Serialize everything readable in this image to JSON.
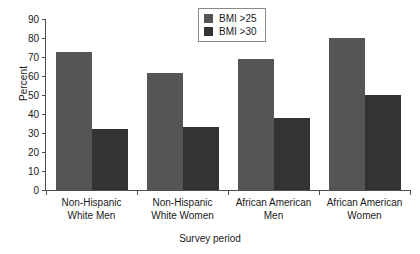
{
  "chart_data": {
    "type": "bar",
    "title": "",
    "xlabel": "Survey period",
    "ylabel": "Percent",
    "categories": [
      "Non-Hispanic\nWhite Men",
      "Non-Hispanic\nWhite Women",
      "African American\nMen",
      "African American\nWomen"
    ],
    "category_lines": [
      [
        "Non-Hispanic",
        "White Men"
      ],
      [
        "Non-Hispanic",
        "White Women"
      ],
      [
        "African American",
        "Men"
      ],
      [
        "African American",
        "Women"
      ]
    ],
    "series": [
      {
        "name": "BMI >25",
        "color": "#555555",
        "values": [
          72.5,
          61.5,
          69,
          80
        ]
      },
      {
        "name": "BMI >30",
        "color": "#333333",
        "values": [
          32,
          33,
          38,
          50
        ]
      }
    ],
    "ylim": [
      0,
      90
    ],
    "yticks": [
      0,
      10,
      20,
      30,
      40,
      50,
      60,
      70,
      80,
      90
    ],
    "ytick_labels": [
      "0",
      "10",
      "20",
      "30",
      "40",
      "50",
      "60",
      "70",
      "80",
      "90"
    ],
    "grid": false,
    "legend_position": "top-center"
  },
  "legend": {
    "entries": [
      {
        "label": "BMI >25",
        "color": "#555555"
      },
      {
        "label": "BMI >30",
        "color": "#333333"
      }
    ]
  }
}
